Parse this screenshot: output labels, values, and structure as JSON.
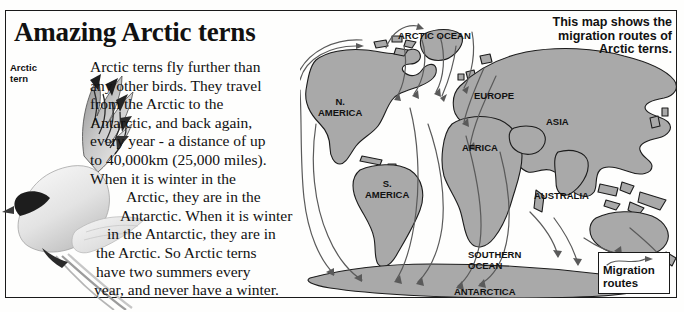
{
  "article": {
    "headline": "Amazing Arctic terns",
    "photo_label_line1": "Arctic",
    "photo_label_line2": "tern",
    "body_lines": [
      "Arctic terns fly further than",
      "any other birds. They travel",
      "from the Arctic to the",
      "Antarctic, and back again,",
      "every year - a distance of up",
      "to 40,000km (25,000 miles).",
      "When it is winter in the",
      "Arctic, they are in the",
      "Antarctic. When it is winter",
      "in the Antarctic, they are in",
      "the Arctic. So Arctic terns",
      "have two summers every",
      "year, and never have a winter."
    ]
  },
  "map": {
    "caption_lines": [
      "This map shows the",
      "migration routes of",
      "Arctic terns."
    ],
    "labels": [
      {
        "name": "arctic-ocean",
        "text": "ARCTIC OCEAN",
        "x": 398,
        "y": 30,
        "size": 9.5
      },
      {
        "name": "north-america",
        "text": "N.\nAMERICA",
        "x": 318,
        "y": 96,
        "size": 9.5
      },
      {
        "name": "south-america",
        "text": "S.\nAMERICA",
        "x": 365,
        "y": 178,
        "size": 9.5
      },
      {
        "name": "europe",
        "text": "EUROPE",
        "x": 474,
        "y": 90,
        "size": 9.5
      },
      {
        "name": "africa",
        "text": "AFRICA",
        "x": 462,
        "y": 142,
        "size": 9.5
      },
      {
        "name": "asia",
        "text": "ASIA",
        "x": 546,
        "y": 116,
        "size": 9.5
      },
      {
        "name": "australia",
        "text": "AUSTRALIA",
        "x": 534,
        "y": 190,
        "size": 9.5
      },
      {
        "name": "southern-ocean",
        "text": "SOUTHERN\nOCEAN",
        "x": 468,
        "y": 249,
        "size": 9.5
      },
      {
        "name": "antarctica",
        "text": "ANTARCTICA",
        "x": 454,
        "y": 286,
        "size": 9.5
      }
    ],
    "legend": {
      "line1": "Migration",
      "line2": "routes"
    },
    "colors": {
      "land": "#a9a9a9",
      "land_outline": "#1c1c1c",
      "route": "#555555",
      "ocean": "#ffffff",
      "text": "#111111"
    }
  }
}
